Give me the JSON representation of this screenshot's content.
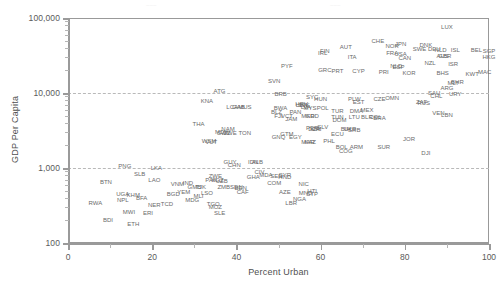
{
  "chart_data": {
    "type": "scatter",
    "title": "",
    "xlabel": "Percent Urban",
    "ylabel": "GDP Per Capita",
    "xlim": [
      0,
      100
    ],
    "ylim": [
      100,
      100000
    ],
    "yscale": "log",
    "xticks": [
      0,
      20,
      40,
      60,
      80,
      100
    ],
    "xtick_labels": [
      "0",
      "20",
      "40",
      "60",
      "80",
      "100"
    ],
    "yticks": [
      100,
      1000,
      10000,
      100000
    ],
    "ytick_labels": [
      "100",
      "1,000",
      "10,000",
      "100,000"
    ],
    "gridlines_y": [
      1000,
      10000
    ],
    "grid": "dashed horizontal at 1,000 and 10,000",
    "legend": "none",
    "marker": "text-label",
    "label_type": "ISO-3 country code",
    "points": [
      {
        "label": "LUX",
        "x": 90.0,
        "y": 75000
      },
      {
        "label": "CHE",
        "x": 73.6,
        "y": 50000
      },
      {
        "label": "JPN",
        "x": 79.0,
        "y": 45000
      },
      {
        "label": "DNK",
        "x": 85.0,
        "y": 44000
      },
      {
        "label": "NOR",
        "x": 77.0,
        "y": 42000
      },
      {
        "label": "AUT",
        "x": 66.0,
        "y": 41000
      },
      {
        "label": "SWE",
        "x": 83.5,
        "y": 39000
      },
      {
        "label": "DEU",
        "x": 87.0,
        "y": 38500
      },
      {
        "label": "NLD",
        "x": 88.5,
        "y": 38000
      },
      {
        "label": "ISL",
        "x": 92.0,
        "y": 38000
      },
      {
        "label": "BEL",
        "x": 97.0,
        "y": 37000
      },
      {
        "label": "SGP",
        "x": 100.0,
        "y": 36000
      },
      {
        "label": "FIN",
        "x": 61.0,
        "y": 36000
      },
      {
        "label": "IRL",
        "x": 60.5,
        "y": 34500
      },
      {
        "label": "FRA",
        "x": 77.0,
        "y": 34000
      },
      {
        "label": "USA",
        "x": 79.0,
        "y": 33000
      },
      {
        "label": "GBR",
        "x": 89.5,
        "y": 31000
      },
      {
        "label": "AUS",
        "x": 89.0,
        "y": 31000
      },
      {
        "label": "HKG",
        "x": 100.0,
        "y": 30000
      },
      {
        "label": "ITA",
        "x": 67.5,
        "y": 30000
      },
      {
        "label": "CAN",
        "x": 80.0,
        "y": 29000
      },
      {
        "label": "NZL",
        "x": 86.0,
        "y": 25000
      },
      {
        "label": "ISR",
        "x": 91.5,
        "y": 24000
      },
      {
        "label": "PYF",
        "x": 52.0,
        "y": 23000
      },
      {
        "label": "NLD2",
        "x": 78.0,
        "y": 23000
      },
      {
        "label": "ESP",
        "x": 78.5,
        "y": 22500
      },
      {
        "label": "GRC",
        "x": 61.0,
        "y": 20000
      },
      {
        "label": "PRT",
        "x": 64.0,
        "y": 19500
      },
      {
        "label": "CYP",
        "x": 69.0,
        "y": 19500
      },
      {
        "label": "PRI",
        "x": 75.0,
        "y": 19000
      },
      {
        "label": "KOR",
        "x": 81.0,
        "y": 18500
      },
      {
        "label": "BHS",
        "x": 89.0,
        "y": 18500
      },
      {
        "label": "KWT",
        "x": 96.0,
        "y": 18000
      },
      {
        "label": "MAC",
        "x": 99.0,
        "y": 19000
      },
      {
        "label": "SVN",
        "x": 49.0,
        "y": 14500
      },
      {
        "label": "BHR",
        "x": 92.5,
        "y": 14000
      },
      {
        "label": "MLT",
        "x": 91.5,
        "y": 13800
      },
      {
        "label": "ARG",
        "x": 90.0,
        "y": 11500
      },
      {
        "label": "ATG",
        "x": 36.0,
        "y": 10500
      },
      {
        "label": "BRB",
        "x": 50.5,
        "y": 9800
      },
      {
        "label": "SAU",
        "x": 87.0,
        "y": 10000
      },
      {
        "label": "URY",
        "x": 92.0,
        "y": 9800
      },
      {
        "label": "KNA",
        "x": 33.0,
        "y": 7800
      },
      {
        "label": "CHL",
        "x": 87.5,
        "y": 9000
      },
      {
        "label": "SYC",
        "x": 58.0,
        "y": 8800
      },
      {
        "label": "HUN",
        "x": 60.0,
        "y": 8200
      },
      {
        "label": "PLW",
        "x": 68.0,
        "y": 8200
      },
      {
        "label": "CZE",
        "x": 74.0,
        "y": 8200
      },
      {
        "label": "OMN",
        "x": 77.0,
        "y": 8500
      },
      {
        "label": "EST",
        "x": 69.0,
        "y": 7500
      },
      {
        "label": "ZAF",
        "x": 84.0,
        "y": 7500
      },
      {
        "label": "RUS",
        "x": 84.5,
        "y": 7400
      },
      {
        "label": "SVK",
        "x": 56.0,
        "y": 7000
      },
      {
        "label": "HRV",
        "x": 55.5,
        "y": 7200
      },
      {
        "label": "LBN",
        "x": 55.5,
        "y": 6900
      },
      {
        "label": "LVA",
        "x": 56.5,
        "y": 6600
      },
      {
        "label": "MUS",
        "x": 42.0,
        "y": 6600
      },
      {
        "label": "GAB",
        "x": 40.5,
        "y": 6500
      },
      {
        "label": "LCA",
        "x": 39.0,
        "y": 6600
      },
      {
        "label": "MYS",
        "x": 57.5,
        "y": 6400
      },
      {
        "label": "BWA",
        "x": 50.5,
        "y": 6300
      },
      {
        "label": "POL",
        "x": 60.5,
        "y": 6300
      },
      {
        "label": "TUR",
        "x": 64.0,
        "y": 5800
      },
      {
        "label": "DMA",
        "x": 68.5,
        "y": 5800
      },
      {
        "label": "MEX",
        "x": 71.0,
        "y": 6000
      },
      {
        "label": "BLZ",
        "x": 49.5,
        "y": 5600
      },
      {
        "label": "PAN",
        "x": 54.0,
        "y": 5600
      },
      {
        "label": "VEN",
        "x": 88.0,
        "y": 5400
      },
      {
        "label": "LBN2",
        "x": 90.0,
        "y": 5100
      },
      {
        "label": "FJI",
        "x": 50.0,
        "y": 5000
      },
      {
        "label": "VCT",
        "x": 52.0,
        "y": 5000
      },
      {
        "label": "MKD",
        "x": 57.0,
        "y": 5000
      },
      {
        "label": "GRD",
        "x": 58.0,
        "y": 5000
      },
      {
        "label": "TUN",
        "x": 64.0,
        "y": 4800
      },
      {
        "label": "LTU",
        "x": 68.0,
        "y": 4800
      },
      {
        "label": "BLR",
        "x": 71.0,
        "y": 4800
      },
      {
        "label": "COL",
        "x": 73.0,
        "y": 4800
      },
      {
        "label": "JAM",
        "x": 53.0,
        "y": 4500
      },
      {
        "label": "DOM",
        "x": 64.5,
        "y": 4400
      },
      {
        "label": "BRA",
        "x": 74.0,
        "y": 4600
      },
      {
        "label": "THA",
        "x": 31.0,
        "y": 3900
      },
      {
        "label": "NAM",
        "x": 38.0,
        "y": 3300
      },
      {
        "label": "SLV",
        "x": 60.5,
        "y": 3500
      },
      {
        "label": "PER",
        "x": 58.0,
        "y": 3400
      },
      {
        "label": "DZA",
        "x": 58.5,
        "y": 3300
      },
      {
        "label": "CRI",
        "x": 59.0,
        "y": 3300
      },
      {
        "label": "UKR",
        "x": 67.0,
        "y": 3300
      },
      {
        "label": "BIH",
        "x": 66.0,
        "y": 3300
      },
      {
        "label": "SRB",
        "x": 68.0,
        "y": 3200
      },
      {
        "label": "MDV",
        "x": 36.5,
        "y": 3000
      },
      {
        "label": "SWZ",
        "x": 37.0,
        "y": 2900
      },
      {
        "label": "ZWE",
        "x": 38.5,
        "y": 2900
      },
      {
        "label": "TON",
        "x": 42.0,
        "y": 2900
      },
      {
        "label": "GTM",
        "x": 52.0,
        "y": 2800
      },
      {
        "label": "ECU",
        "x": 64.0,
        "y": 2800
      },
      {
        "label": "EGY",
        "x": 54.0,
        "y": 2600
      },
      {
        "label": "GNQ",
        "x": 50.0,
        "y": 2600
      },
      {
        "label": "PHL",
        "x": 62.0,
        "y": 2300
      },
      {
        "label": "WSM",
        "x": 33.5,
        "y": 2300
      },
      {
        "label": "VUT",
        "x": 34.0,
        "y": 2200
      },
      {
        "label": "MAR",
        "x": 57.0,
        "y": 2200
      },
      {
        "label": "KAZ",
        "x": 57.5,
        "y": 2200
      },
      {
        "label": "ARM",
        "x": 68.5,
        "y": 1900
      },
      {
        "label": "BOL",
        "x": 65.0,
        "y": 1900
      },
      {
        "label": "COG",
        "x": 66.0,
        "y": 1700
      },
      {
        "label": "JOR",
        "x": 81.0,
        "y": 2400
      },
      {
        "label": "SUR",
        "x": 75.0,
        "y": 1900
      },
      {
        "label": "DJI",
        "x": 85.0,
        "y": 1600
      },
      {
        "label": "GUY",
        "x": 38.5,
        "y": 1200
      },
      {
        "label": "CHN",
        "x": 39.5,
        "y": 1100
      },
      {
        "label": "IDN",
        "x": 44.0,
        "y": 1200
      },
      {
        "label": "ALB",
        "x": 45.0,
        "y": 1200
      },
      {
        "label": "PNG",
        "x": 13.5,
        "y": 1050
      },
      {
        "label": "LKA",
        "x": 21.0,
        "y": 1000
      },
      {
        "label": "SLB",
        "x": 17.0,
        "y": 830
      },
      {
        "label": "MDA",
        "x": 47.0,
        "y": 800
      },
      {
        "label": "CIV",
        "x": 45.5,
        "y": 880
      },
      {
        "label": "SYR",
        "x": 51.5,
        "y": 800
      },
      {
        "label": "SEN",
        "x": 49.5,
        "y": 780
      },
      {
        "label": "HND",
        "x": 51.5,
        "y": 760
      },
      {
        "label": "LAO",
        "x": 20.5,
        "y": 700
      },
      {
        "label": "GHA",
        "x": 44.0,
        "y": 750
      },
      {
        "label": "ZWE2",
        "x": 35.0,
        "y": 780
      },
      {
        "label": "KGZ",
        "x": 35.5,
        "y": 700
      },
      {
        "label": "PAK",
        "x": 34.0,
        "y": 700
      },
      {
        "label": "UZB",
        "x": 36.5,
        "y": 680
      },
      {
        "label": "BTN",
        "x": 9.0,
        "y": 650
      },
      {
        "label": "IND",
        "x": 28.5,
        "y": 640
      },
      {
        "label": "VNM",
        "x": 26.0,
        "y": 620
      },
      {
        "label": "NIC",
        "x": 56.0,
        "y": 620
      },
      {
        "label": "SDN",
        "x": 40.0,
        "y": 550
      },
      {
        "label": "ZMB",
        "x": 37.0,
        "y": 560
      },
      {
        "label": "BEN",
        "x": 41.0,
        "y": 540
      },
      {
        "label": "CAF",
        "x": 41.5,
        "y": 480
      },
      {
        "label": "AZE",
        "x": 51.5,
        "y": 480
      },
      {
        "label": "MNG",
        "x": 56.5,
        "y": 470
      },
      {
        "label": "HTI",
        "x": 58.0,
        "y": 500
      },
      {
        "label": "GMB",
        "x": 30.0,
        "y": 550
      },
      {
        "label": "TJK",
        "x": 31.5,
        "y": 550
      },
      {
        "label": "UGA",
        "x": 13.0,
        "y": 450
      },
      {
        "label": "KHM",
        "x": 15.5,
        "y": 430
      },
      {
        "label": "BFA",
        "x": 17.5,
        "y": 400
      },
      {
        "label": "NPL",
        "x": 13.0,
        "y": 380
      },
      {
        "label": "YEM",
        "x": 27.5,
        "y": 480
      },
      {
        "label": "MLI",
        "x": 31.0,
        "y": 420
      },
      {
        "label": "MDG",
        "x": 29.5,
        "y": 380
      },
      {
        "label": "STP",
        "x": 58.0,
        "y": 450
      },
      {
        "label": "NGA",
        "x": 55.0,
        "y": 390
      },
      {
        "label": "LBR",
        "x": 53.0,
        "y": 340
      },
      {
        "label": "RWA",
        "x": 6.5,
        "y": 340
      },
      {
        "label": "NER",
        "x": 20.5,
        "y": 320
      },
      {
        "label": "TCD",
        "x": 23.5,
        "y": 330
      },
      {
        "label": "MWI",
        "x": 14.5,
        "y": 260
      },
      {
        "label": "ERI",
        "x": 19.0,
        "y": 250
      },
      {
        "label": "SLE",
        "x": 36.0,
        "y": 250
      },
      {
        "label": "BDI",
        "x": 9.5,
        "y": 200
      },
      {
        "label": "ETH",
        "x": 15.5,
        "y": 180
      },
      {
        "label": "MOZ",
        "x": 35.0,
        "y": 300
      },
      {
        "label": "TGO",
        "x": 34.5,
        "y": 330
      },
      {
        "label": "COM",
        "x": 49.0,
        "y": 640
      },
      {
        "label": "BGD",
        "x": 25.0,
        "y": 450
      },
      {
        "label": "LSO",
        "x": 33.0,
        "y": 470
      }
    ]
  },
  "axes": {
    "y_title": "GDP Per Capita",
    "x_title": "Percent Urban",
    "y_ticks": [
      "100,000",
      "10,000",
      "1,000",
      "100"
    ],
    "x_ticks": [
      "0",
      "20",
      "40",
      "60",
      "80",
      "100"
    ]
  },
  "style": {
    "label_color": "#6a6a6a",
    "axis_color": "#9a9a9a",
    "grid_color": "#b9b9b9",
    "background": "#ffffff"
  }
}
